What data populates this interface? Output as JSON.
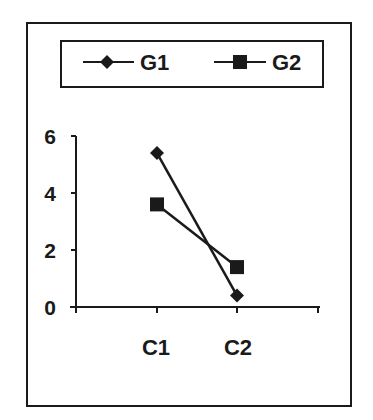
{
  "chart_data": {
    "type": "line",
    "title": "",
    "xlabel": "",
    "ylabel": "",
    "categories": [
      "C1",
      "C2"
    ],
    "series": [
      {
        "name": "G1",
        "marker": "diamond",
        "values": [
          5.4,
          0.4
        ]
      },
      {
        "name": "G2",
        "marker": "square",
        "values": [
          3.6,
          1.4
        ]
      }
    ],
    "ylim": [
      0,
      6
    ],
    "yticks": [
      "0",
      "2",
      "4",
      "6"
    ],
    "grid": false,
    "legend_position": "top"
  },
  "legend": {
    "items": [
      {
        "label": "G1",
        "marker": "diamond-icon"
      },
      {
        "label": "G2",
        "marker": "square-icon"
      }
    ]
  },
  "colors": {
    "ink": "#1a1a1a",
    "background": "#ffffff"
  }
}
